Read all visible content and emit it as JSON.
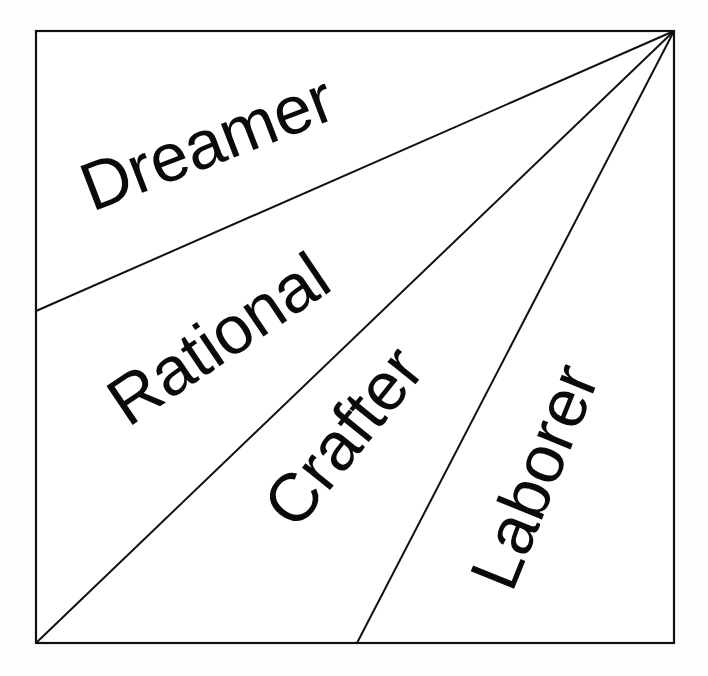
{
  "diagram": {
    "type": "fan-partitioned square",
    "frame": {
      "x1": 36,
      "y1": 31,
      "x2": 674,
      "y2": 643
    },
    "apex": {
      "x": 674,
      "y": 31
    },
    "dividers": [
      {
        "name": "dreamer-rational-boundary",
        "x2": 36,
        "y2": 311
      },
      {
        "name": "rational-crafter-boundary",
        "x2": 36,
        "y2": 643
      },
      {
        "name": "crafter-laborer-boundary",
        "x2": 357,
        "y2": 643
      }
    ],
    "labels": [
      {
        "text": "Dreamer",
        "x": 92,
        "y": 212,
        "angle": -21
      },
      {
        "text": "Rational",
        "x": 128,
        "y": 428,
        "angle": -34
      },
      {
        "text": "Crafter",
        "x": 296,
        "y": 532,
        "angle": -51
      },
      {
        "text": "Laborer",
        "x": 512,
        "y": 594,
        "angle": -68
      }
    ],
    "colors": {
      "line": "#111111",
      "text": "#0a0a0a",
      "background": "#ffffff"
    }
  }
}
